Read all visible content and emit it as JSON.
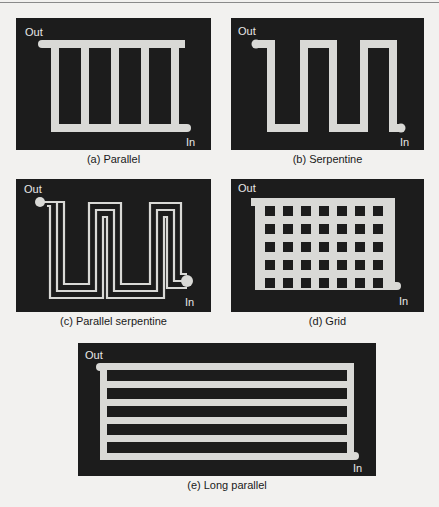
{
  "figure": {
    "panels": [
      {
        "id": "a",
        "caption": "(a) Parallel",
        "out_label": "Out",
        "in_label": "In",
        "channels": 5
      },
      {
        "id": "b",
        "caption": "(b) Serpentine",
        "out_label": "Out",
        "in_label": "In",
        "passes": 6
      },
      {
        "id": "c",
        "caption": "(c) Parallel serpentine",
        "out_label": "Out",
        "in_label": "In",
        "parallel_channels": 3
      },
      {
        "id": "d",
        "caption": "(d) Grid",
        "out_label": "Out",
        "in_label": "In",
        "grid_rows": 5,
        "grid_cols": 7
      },
      {
        "id": "e",
        "caption": "(e) Long parallel",
        "out_label": "Out",
        "in_label": "In",
        "channels": 6
      }
    ],
    "colors": {
      "background": "#1c1c1c",
      "channel": "#d9d9d6",
      "page": "#f2f1ef"
    }
  }
}
